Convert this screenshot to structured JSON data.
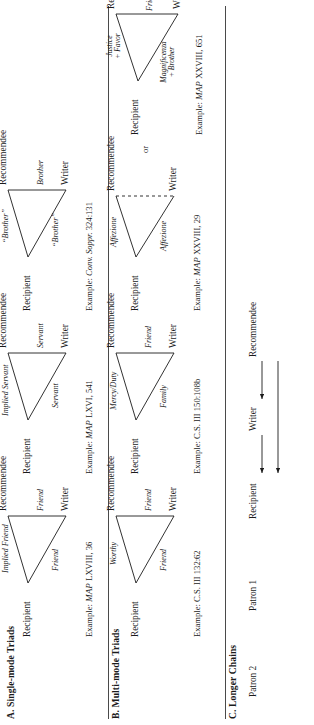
{
  "figure": {
    "sections": [
      {
        "key": "a",
        "label": "A. Single-mode Triads",
        "triads": [
          {
            "apex": "Recipient",
            "left_node": "Writer",
            "right_node": "Recommendee",
            "edge_left": "Friend",
            "edge_right": "Implied Friend",
            "edge_base": "Friend",
            "citation_prefix": "Example: ",
            "citation_italic": "MAP",
            "citation_rest": " LXVIII, 36",
            "dashed": false
          },
          {
            "apex": "Recipient",
            "left_node": "Writer",
            "right_node": "Recommendee",
            "edge_left": "Servant",
            "edge_right": "Implied Servant",
            "edge_base": "Servant",
            "citation_prefix": "Example: ",
            "citation_italic": "MAP",
            "citation_rest": " LXVI, 541",
            "dashed": false
          },
          {
            "apex": "Recipient",
            "left_node": "Writer",
            "right_node": "Recommendee",
            "edge_left": "“Brother”",
            "edge_right": "“Brother”",
            "edge_base": "Brother",
            "citation_prefix": "Example: ",
            "citation_italic": "Conv. Soppr.",
            "citation_rest": " 324:131",
            "dashed": false
          }
        ]
      },
      {
        "key": "b",
        "label": "B. Multi-mode Triads",
        "triads": [
          {
            "apex": "Recipient",
            "left_node": "Writer",
            "right_node": "Recommendee",
            "edge_left": "Friend",
            "edge_right": "Worthy",
            "edge_base": "Friend",
            "citation_prefix": "Example: ",
            "citation_italic": "",
            "citation_rest": "C.S. III 132:62",
            "dashed": false
          },
          {
            "apex": "Recipient",
            "left_node": "Writer",
            "right_node": "Recommendee",
            "edge_left": "Family",
            "edge_right": "Mercy/Duty",
            "edge_base": "Friend",
            "citation_prefix": "Example: ",
            "citation_italic": "",
            "citation_rest": "C.S. III 150:108b",
            "dashed": false
          },
          {
            "apex": "Recipient",
            "left_node": "Writer",
            "right_node": "Recommendee",
            "edge_left": "Affezione",
            "edge_right": "Affezione",
            "edge_base": "",
            "citation_prefix": "Example: ",
            "citation_italic": "MAP",
            "citation_rest": " XXVIII, 29",
            "dashed": true
          },
          {
            "apex": "Recipient",
            "left_node": "Writer",
            "right_node": "Recommendee",
            "edge_left": "Magnificenza\n+ Brother",
            "edge_right": "Justice\n+ Favor",
            "edge_base": "Friend + Worthy",
            "citation_prefix": "Example: ",
            "citation_italic": "MAP",
            "citation_rest": " XXVIII, 651",
            "dashed": false
          }
        ],
        "connector_word": "or"
      },
      {
        "key": "c",
        "label": "C. Longer Chains",
        "chain": {
          "nodes": [
            "Patron 2",
            "Patron 1",
            "Recipient",
            "Writer",
            "Recommendee"
          ],
          "arrow_targets": [
            "Recipient",
            "Writer",
            "Recipient"
          ]
        }
      }
    ]
  },
  "style": {
    "ink": "#1b1b1b",
    "rule": "#4a4a4a",
    "paper": "#ffffff"
  }
}
